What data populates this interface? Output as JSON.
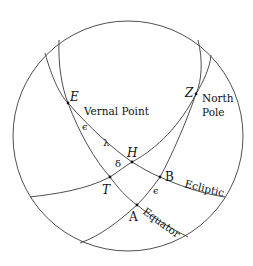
{
  "diagram": {
    "type": "celestial-sphere",
    "points": {
      "E": "E",
      "Z": "Z",
      "H": "H",
      "T": "T",
      "B": "B",
      "A": "A"
    },
    "labels": {
      "vernal_point": "Vernal Point",
      "north": "North",
      "pole": "Pole",
      "ecliptic": "Ecliptic",
      "equator": "Equator"
    },
    "angles": {
      "epsilon_upper": "ϵ",
      "lambda": "λ",
      "delta": "δ",
      "epsilon_lower": "ϵ"
    },
    "stroke_color": "#3a3a3a"
  }
}
